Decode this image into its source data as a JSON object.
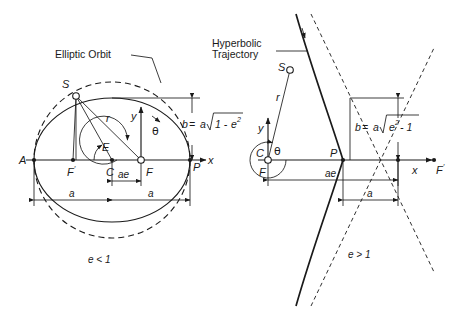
{
  "figure": {
    "background_color": "#ffffff",
    "ink_color": "#1a1a1a",
    "width": 459,
    "height": 323
  },
  "panels": [
    {
      "id": "elliptic",
      "callout": "Elliptic Orbit",
      "eccentricity_condition": "e < 1",
      "semi_minor_formula": {
        "lhs": "b",
        "equals": "=",
        "coefficient": "a",
        "radicand_left": "1 - ",
        "radicand_base": "e",
        "radicand_exponent": "2"
      },
      "points": [
        {
          "name": "A",
          "label": "A"
        },
        {
          "name": "F-prime",
          "label": "F",
          "prime": "′"
        },
        {
          "name": "C",
          "label": "C"
        },
        {
          "name": "F",
          "label": "F"
        },
        {
          "name": "P",
          "label": "P"
        },
        {
          "name": "S",
          "label": "S"
        }
      ],
      "axes": [
        {
          "name": "x-axis",
          "label": "x"
        },
        {
          "name": "y-axis",
          "label": "y"
        }
      ],
      "angles": [
        {
          "name": "eccentric-anomaly",
          "label": "E"
        },
        {
          "name": "true-anomaly",
          "label": "θ"
        }
      ],
      "vectors": [
        {
          "name": "radius-vector",
          "label": "r"
        }
      ],
      "dimensions": [
        {
          "name": "semi-major-left",
          "label": "a"
        },
        {
          "name": "semi-major-right",
          "label": "a"
        },
        {
          "name": "center-focus-distance",
          "label": "ae"
        },
        {
          "name": "semi-minor-axis",
          "label": "b"
        }
      ]
    },
    {
      "id": "hyperbolic",
      "callout_line1": "Hyperbolic",
      "callout_line2": "Trajectory",
      "eccentricity_condition": "e > 1",
      "semi_minor_formula": {
        "lhs": "b",
        "equals": "=",
        "coefficient": "a",
        "radicand_base": "e",
        "radicand_exponent": "2",
        "radicand_right": " - 1"
      },
      "points": [
        {
          "name": "C",
          "label": "C"
        },
        {
          "name": "F",
          "label": "F"
        },
        {
          "name": "P",
          "label": "P"
        },
        {
          "name": "S",
          "label": "S"
        },
        {
          "name": "F-prime",
          "label": "F",
          "prime": "′"
        }
      ],
      "axes": [
        {
          "name": "x-axis",
          "label": "x"
        },
        {
          "name": "y-axis",
          "label": "y"
        }
      ],
      "angles": [
        {
          "name": "true-anomaly",
          "label": "θ"
        }
      ],
      "vectors": [
        {
          "name": "radius-vector",
          "label": "r"
        }
      ],
      "dimensions": [
        {
          "name": "center-focus-distance",
          "label": "ae"
        },
        {
          "name": "semi-transverse-axis",
          "label": "a"
        },
        {
          "name": "semi-conjugate-axis",
          "label": "b"
        }
      ]
    }
  ]
}
